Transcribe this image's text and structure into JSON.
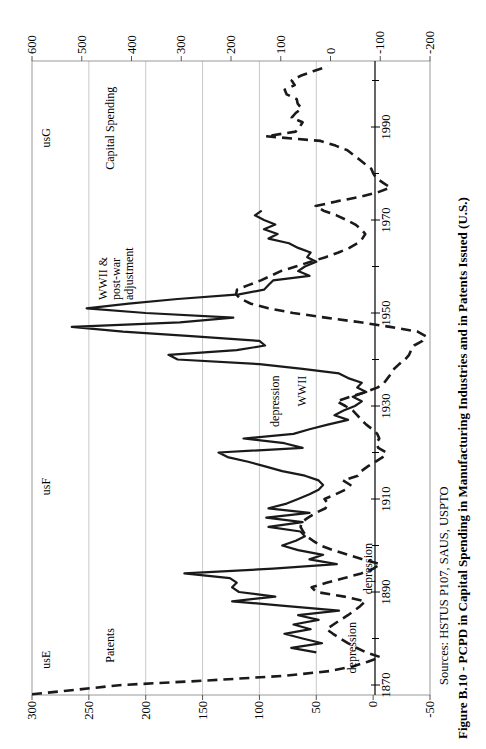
{
  "figure": {
    "background_color": "#ffffff",
    "line_color": "#1a1a1a",
    "grid_color": "#c9c9c9",
    "border_color": "#999999",
    "orientation": "rotated-90-ccw"
  },
  "chart_data": {
    "type": "line",
    "title": "Figure B.10 - PCPD in Capital Spending in Manufacturing Industries and in Patents Issued (U.S.)",
    "sources": "Sources: HSTUS P107, SAUS, USPTO",
    "grid": "horizontal",
    "legend_position": "none",
    "x_axis": {
      "range": [
        1866,
        2005
      ],
      "label_years": [
        1870,
        1890,
        1910,
        1930,
        1950,
        1970,
        1990
      ],
      "minor_tick_step": 10
    },
    "left_axis": {
      "range": [
        -50,
        300
      ],
      "ticks": [
        300,
        250,
        200,
        150,
        100,
        50,
        0,
        -50
      ],
      "series": "Capital Spending"
    },
    "right_axis": {
      "range": [
        -200,
        600
      ],
      "ticks": [
        600,
        500,
        400,
        300,
        200,
        100,
        0,
        -100,
        -200
      ],
      "series": "Patents"
    },
    "series": [
      {
        "name": "Capital Spending",
        "style": "solid",
        "axis": "left",
        "points": [
          [
            1877,
            50
          ],
          [
            1878,
            72
          ],
          [
            1879,
            45
          ],
          [
            1880,
            62
          ],
          [
            1881,
            78
          ],
          [
            1882,
            55
          ],
          [
            1883,
            70
          ],
          [
            1884,
            48
          ],
          [
            1885,
            66
          ],
          [
            1886,
            30
          ],
          [
            1887,
            78
          ],
          [
            1888,
            124
          ],
          [
            1889,
            86
          ],
          [
            1890,
            118
          ],
          [
            1891,
            124
          ],
          [
            1892,
            120
          ],
          [
            1893,
            126
          ],
          [
            1894,
            166
          ],
          [
            1895,
            88
          ],
          [
            1896,
            32
          ],
          [
            1897,
            56
          ],
          [
            1898,
            44
          ],
          [
            1899,
            66
          ],
          [
            1900,
            80
          ],
          [
            1901,
            68
          ],
          [
            1902,
            60
          ],
          [
            1903,
            64
          ],
          [
            1904,
            92
          ],
          [
            1905,
            62
          ],
          [
            1906,
            94
          ],
          [
            1907,
            56
          ],
          [
            1908,
            92
          ],
          [
            1909,
            76
          ],
          [
            1910,
            66
          ],
          [
            1911,
            56
          ],
          [
            1912,
            48
          ],
          [
            1913,
            44
          ],
          [
            1914,
            48
          ],
          [
            1915,
            60
          ],
          [
            1916,
            80
          ],
          [
            1917,
            95
          ],
          [
            1918,
            110
          ],
          [
            1919,
            128
          ],
          [
            1920,
            136
          ],
          [
            1921,
            62
          ],
          [
            1922,
            78
          ],
          [
            1923,
            114
          ],
          [
            1924,
            70
          ],
          [
            1925,
            56
          ],
          [
            1926,
            40
          ],
          [
            1927,
            22
          ],
          [
            1928,
            34
          ],
          [
            1929,
            26
          ],
          [
            1930,
            16
          ],
          [
            1931,
            10
          ],
          [
            1932,
            18
          ],
          [
            1933,
            6
          ],
          [
            1934,
            14
          ],
          [
            1935,
            10
          ],
          [
            1936,
            22
          ],
          [
            1937,
            30
          ],
          [
            1938,
            62
          ],
          [
            1939,
            100
          ],
          [
            1940,
            172
          ],
          [
            1941,
            180
          ],
          [
            1942,
            120
          ],
          [
            1943,
            95
          ],
          [
            1944,
            100
          ],
          [
            1945,
            160
          ],
          [
            1946,
            220
          ],
          [
            1947,
            265
          ],
          [
            1948,
            170
          ],
          [
            1949,
            123
          ],
          [
            1950,
            200
          ],
          [
            1951,
            252
          ],
          [
            1952,
            215
          ],
          [
            1953,
            172
          ],
          [
            1954,
            118
          ],
          [
            1955,
            96
          ],
          [
            1956,
            92
          ],
          [
            1957,
            88
          ],
          [
            1958,
            56
          ],
          [
            1959,
            66
          ],
          [
            1960,
            60
          ],
          [
            1961,
            50
          ],
          [
            1962,
            58
          ],
          [
            1963,
            55
          ],
          [
            1964,
            66
          ],
          [
            1965,
            74
          ],
          [
            1966,
            92
          ],
          [
            1967,
            84
          ],
          [
            1968,
            96
          ],
          [
            1969,
            86
          ],
          [
            1970,
            96
          ],
          [
            1971,
            104
          ],
          [
            1972,
            98
          ]
        ]
      },
      {
        "name": "Patents",
        "style": "dashed",
        "axis": "right",
        "points": [
          [
            1868,
            600
          ],
          [
            1870,
            420
          ],
          [
            1871,
            240
          ],
          [
            1872,
            90
          ],
          [
            1873,
            0
          ],
          [
            1874,
            -45
          ],
          [
            1875,
            -75
          ],
          [
            1876,
            -100
          ],
          [
            1877,
            -72
          ],
          [
            1878,
            -52
          ],
          [
            1879,
            -35
          ],
          [
            1880,
            -20
          ],
          [
            1881,
            -5
          ],
          [
            1882,
            8
          ],
          [
            1883,
            -6
          ],
          [
            1884,
            -20
          ],
          [
            1885,
            -35
          ],
          [
            1886,
            -48
          ],
          [
            1887,
            -60
          ],
          [
            1888,
            -70
          ],
          [
            1889,
            -28
          ],
          [
            1890,
            28
          ],
          [
            1891,
            38
          ],
          [
            1892,
            8
          ],
          [
            1893,
            -28
          ],
          [
            1894,
            -62
          ],
          [
            1895,
            -86
          ],
          [
            1896,
            -100
          ],
          [
            1897,
            -65
          ],
          [
            1898,
            -35
          ],
          [
            1899,
            -5
          ],
          [
            1900,
            20
          ],
          [
            1901,
            35
          ],
          [
            1902,
            48
          ],
          [
            1903,
            55
          ],
          [
            1904,
            60
          ],
          [
            1905,
            58
          ],
          [
            1906,
            45
          ],
          [
            1907,
            30
          ],
          [
            1908,
            10
          ],
          [
            1909,
            5
          ],
          [
            1910,
            12
          ],
          [
            1911,
            -10
          ],
          [
            1912,
            -30
          ],
          [
            1913,
            -40
          ],
          [
            1914,
            -25
          ],
          [
            1915,
            -55
          ],
          [
            1916,
            -62
          ],
          [
            1917,
            -75
          ],
          [
            1918,
            -90
          ],
          [
            1919,
            -105
          ],
          [
            1920,
            -112
          ],
          [
            1921,
            -96
          ],
          [
            1922,
            -92
          ],
          [
            1923,
            -98
          ],
          [
            1924,
            -94
          ],
          [
            1925,
            -84
          ],
          [
            1926,
            -72
          ],
          [
            1927,
            -62
          ],
          [
            1928,
            -54
          ],
          [
            1929,
            -45
          ],
          [
            1930,
            -30
          ],
          [
            1931,
            -12
          ],
          [
            1932,
            -40
          ],
          [
            1933,
            -70
          ],
          [
            1934,
            -95
          ],
          [
            1935,
            -108
          ],
          [
            1936,
            -115
          ],
          [
            1937,
            -122
          ],
          [
            1938,
            -128
          ],
          [
            1939,
            -138
          ],
          [
            1940,
            -150
          ],
          [
            1941,
            -158
          ],
          [
            1942,
            -162
          ],
          [
            1943,
            -168
          ],
          [
            1944,
            -185
          ],
          [
            1945,
            -192
          ],
          [
            1946,
            -175
          ],
          [
            1947,
            -120
          ],
          [
            1948,
            -60
          ],
          [
            1949,
            10
          ],
          [
            1950,
            75
          ],
          [
            1951,
            125
          ],
          [
            1952,
            160
          ],
          [
            1953,
            180
          ],
          [
            1954,
            190
          ],
          [
            1955,
            188
          ],
          [
            1956,
            165
          ],
          [
            1957,
            140
          ],
          [
            1958,
            120
          ],
          [
            1959,
            100
          ],
          [
            1960,
            70
          ],
          [
            1961,
            40
          ],
          [
            1962,
            10
          ],
          [
            1963,
            -16
          ],
          [
            1964,
            -38
          ],
          [
            1965,
            -54
          ],
          [
            1966,
            -64
          ],
          [
            1967,
            -70
          ],
          [
            1968,
            -62
          ],
          [
            1969,
            -50
          ],
          [
            1970,
            -32
          ],
          [
            1971,
            -12
          ],
          [
            1972,
            14
          ],
          [
            1973,
            30
          ],
          [
            1974,
            -12
          ],
          [
            1975,
            -60
          ],
          [
            1976,
            -96
          ],
          [
            1977,
            -120
          ],
          [
            1978,
            -106
          ],
          [
            1979,
            -92
          ],
          [
            1980,
            -86
          ],
          [
            1981,
            -82
          ],
          [
            1982,
            -70
          ],
          [
            1983,
            -58
          ],
          [
            1984,
            -46
          ],
          [
            1985,
            -34
          ],
          [
            1986,
            -10
          ],
          [
            1987,
            20
          ],
          [
            1988,
            130
          ],
          [
            1989,
            70
          ],
          [
            1990,
            62
          ],
          [
            1991,
            56
          ],
          [
            1992,
            78
          ],
          [
            1993,
            70
          ],
          [
            1994,
            58
          ],
          [
            1995,
            66
          ],
          [
            1996,
            68
          ],
          [
            1997,
            88
          ],
          [
            1998,
            92
          ],
          [
            1999,
            72
          ],
          [
            2000,
            78
          ],
          [
            2001,
            60
          ],
          [
            2002,
            35
          ],
          [
            2003,
            5
          ]
        ]
      }
    ],
    "annotations": [
      {
        "text": "usE",
        "year": 1873.5,
        "v_left": 293
      },
      {
        "text": "Patents",
        "year": 1874.8,
        "v_left": 237
      },
      {
        "text": "usF",
        "year": 1910.8,
        "v_left": 293
      },
      {
        "text": "usG",
        "year": 1985.6,
        "v_left": 293
      },
      {
        "text": "Capital Spending",
        "year": 1980.8,
        "v_left": 237
      },
      {
        "text": "WWII &\npost-war\nadjustment",
        "year": 1952.8,
        "v_left": 243
      },
      {
        "text": "depression",
        "year": 1872.5,
        "v_left": 24
      },
      {
        "text": "depression",
        "year": 1889.5,
        "v_left": 10
      },
      {
        "text": "depression",
        "year": 1925.5,
        "v_left": 92
      },
      {
        "text": "WWII",
        "year": 1929.9,
        "v_left": 68
      }
    ]
  }
}
